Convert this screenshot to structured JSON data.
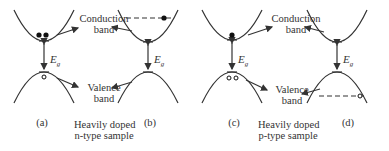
{
  "figure": {
    "panels": [
      {
        "id": "a",
        "label": "(a)",
        "electrons": 2,
        "holes": 1,
        "fermi_line": "none"
      },
      {
        "id": "b",
        "label": "(b)",
        "electrons": 1,
        "holes": 0,
        "fermi_line": "conduction"
      },
      {
        "id": "c",
        "label": "(c)",
        "electrons": 1,
        "holes": 2,
        "fermi_line": "none"
      },
      {
        "id": "d",
        "label": "(d)",
        "electrons": 0,
        "holes": 1,
        "fermi_line": "valence"
      }
    ],
    "left": {
      "conduction_label_1": "Conduction",
      "conduction_label_2": "band",
      "valence_label_1": "Valence",
      "valence_label_2": "band",
      "caption_1": "Heavily doped",
      "caption_2": "n-type sample"
    },
    "right": {
      "conduction_label_1": "Conduction",
      "conduction_label_2": "band",
      "valence_label_1": "Valence",
      "valence_label_2": "band",
      "caption_1": "Heavily doped",
      "caption_2": "p-type sample"
    },
    "gap_symbol": "E",
    "gap_subscript": "g"
  }
}
